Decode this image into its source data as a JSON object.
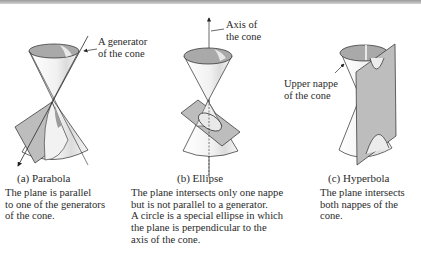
{
  "figure": {
    "panels": [
      {
        "id": "a",
        "title": "(a) Parabola",
        "annotation": [
          "A generator",
          "of the cone"
        ],
        "description": [
          "The plane is parallel",
          "to one of the generators",
          "of the cone."
        ]
      },
      {
        "id": "b",
        "title": "(b) Ellipse",
        "annotation": [
          "Axis of",
          "the cone"
        ],
        "description": [
          "The plane intersects only one nappe",
          "but is not parallel to a generator.",
          "A circle is a special ellipse in which",
          "the plane is perpendicular to the",
          "axis of the cone."
        ]
      },
      {
        "id": "c",
        "title": "(c) Hyperbola",
        "annotation": [
          "Upper nappe",
          "of the cone"
        ],
        "description": [
          "The plane intersects",
          "both nappes of the",
          "cone."
        ]
      }
    ],
    "colors": {
      "cone_fill": "#f4f4f4",
      "cone_inner": "#a9a9a9",
      "plane_fill": "#bdbdbd",
      "stroke": "#2a2a2a"
    }
  }
}
